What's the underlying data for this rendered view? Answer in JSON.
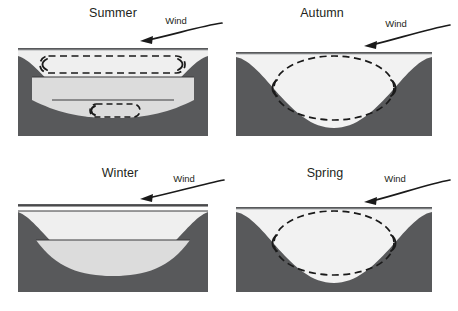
{
  "figure": {
    "background_color": "#ffffff",
    "width": 458,
    "height": 311
  },
  "colors": {
    "basin_rock": "#58595b",
    "epilimnion": "#efefef",
    "metalimnion": "#dcdcdc",
    "hypolimnion": "#dcdcdc",
    "mixed_water": "#f2f2f2",
    "ice": "#fdfdfd",
    "surface_line": "#a7a9ac",
    "layer_line": "#3b3b3d",
    "arrow": "#1a1a1a",
    "text": "#231f20"
  },
  "wind_label": "Wind",
  "panels": [
    {
      "id": "summer",
      "title": "Summer",
      "wind_label": "Wind",
      "stratified": true,
      "ice_cover": false,
      "layers": [
        "epilimnion",
        "metalimnion",
        "hypolimnion"
      ],
      "layer_boundary_count": 2,
      "mixing_cells": 2,
      "mixing_description": "Two separate circulation cells: a wide shallow cell in the epilimnion and a small cell in the hypolimnion"
    },
    {
      "id": "autumn",
      "title": "Autumn",
      "wind_label": "Wind",
      "stratified": false,
      "ice_cover": false,
      "layers": [
        "mixed"
      ],
      "layer_boundary_count": 0,
      "mixing_cells": 1,
      "mixing_description": "Single large circulation ellipse spanning the full water column (turnover)"
    },
    {
      "id": "winter",
      "title": "Winter",
      "wind_label": "Wind",
      "stratified": true,
      "ice_cover": true,
      "layers": [
        "ice",
        "inverse-epilimnion",
        "hypolimnion"
      ],
      "layer_boundary_count": 2,
      "mixing_cells": 0,
      "mixing_description": "Ice cover present, no circulation cells (inverse stratification)"
    },
    {
      "id": "spring",
      "title": "Spring",
      "wind_label": "Wind",
      "stratified": false,
      "ice_cover": false,
      "layers": [
        "mixed"
      ],
      "layer_boundary_count": 0,
      "mixing_cells": 1,
      "mixing_description": "Single large circulation ellipse spanning the full water column (turnover)"
    }
  ]
}
